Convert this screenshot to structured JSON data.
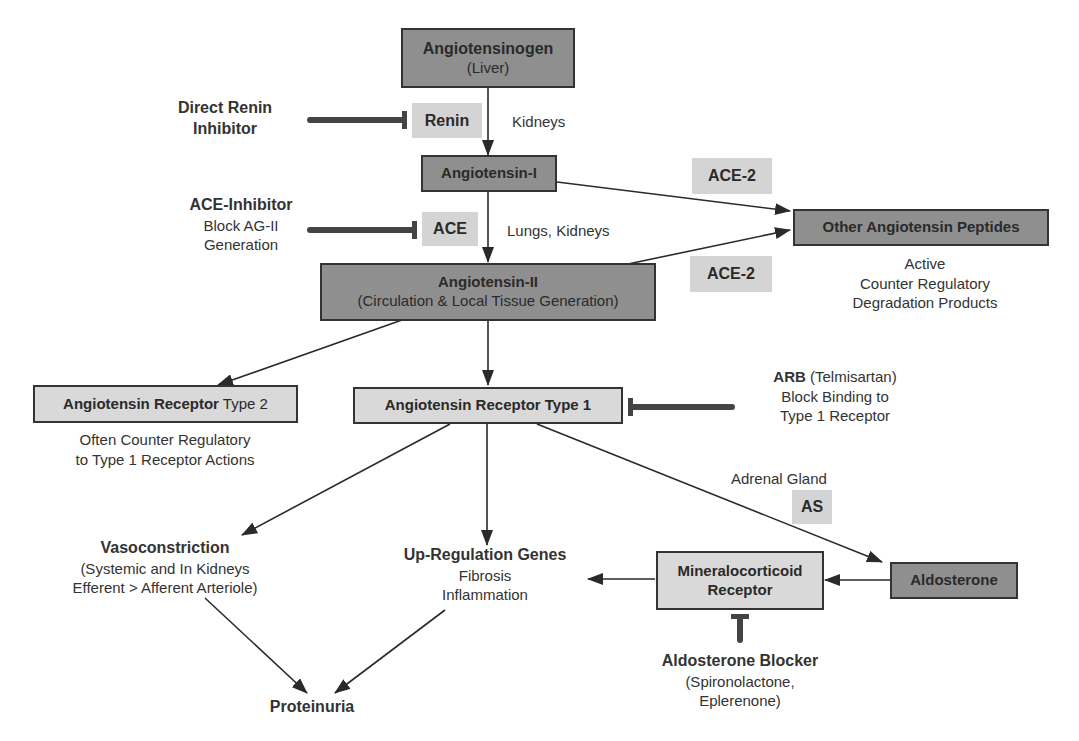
{
  "nodes": {
    "angiotensinogen": {
      "title": "Angiotensinogen",
      "subtitle": "(Liver)"
    },
    "angiotensin1": {
      "title": "Angiotensin-I"
    },
    "angiotensin2": {
      "title": "Angiotensin-II",
      "subtitle": "(Circulation & Local Tissue Generation)"
    },
    "other_peptides": {
      "title": "Other Angiotensin Peptides",
      "notes": [
        "Active",
        "Counter Regulatory",
        "Degradation Products"
      ]
    },
    "receptor_type2": {
      "title_bold": "Angiotensin Receptor",
      "title_normal": " Type 2",
      "notes": [
        "Often Counter Regulatory",
        "to Type 1 Receptor Actions"
      ]
    },
    "receptor_type1": {
      "title": "Angiotensin Receptor Type 1"
    },
    "mineralocorticoid": {
      "line1": "Mineralocorticoid",
      "line2": "Receptor"
    },
    "aldosterone": {
      "title": "Aldosterone"
    },
    "vasoconstriction": {
      "title": "Vasoconstriction",
      "lines": [
        "(Systemic and In Kidneys",
        "Efferent > Afferent Arteriole)"
      ]
    },
    "upregulation": {
      "title": "Up-Regulation Genes",
      "lines": [
        "Fibrosis",
        "Inflammation"
      ]
    },
    "proteinuria": {
      "title": "Proteinuria"
    }
  },
  "enzymes": {
    "renin": "Renin",
    "ace": "ACE",
    "ace2_top": "ACE-2",
    "ace2_bottom": "ACE-2",
    "as": "AS"
  },
  "locations": {
    "kidneys": "Kidneys",
    "lungs_kidneys": "Lungs, Kidneys",
    "adrenal": "Adrenal Gland"
  },
  "inhibitors": {
    "direct_renin": {
      "line1": "Direct Renin",
      "line2": "Inhibitor"
    },
    "ace_inhibitor": {
      "title": "ACE-Inhibitor",
      "line1": "Block AG-II",
      "line2": "Generation"
    },
    "arb": {
      "bold": "ARB",
      "normal": " (Telmisartan)",
      "line1": "Block Binding to",
      "line2": "Type 1 Receptor"
    },
    "aldosterone_blocker": {
      "title": "Aldosterone Blocker",
      "line1": "(Spironolactone,",
      "line2": "Eplerenone)"
    }
  },
  "colors": {
    "dark_box": "#8f8f8f",
    "light_box": "#d9d9d9",
    "enzyme_box": "#d4d4d4",
    "line": "#2a2a2a",
    "inhibitor_bar": "#444444"
  }
}
